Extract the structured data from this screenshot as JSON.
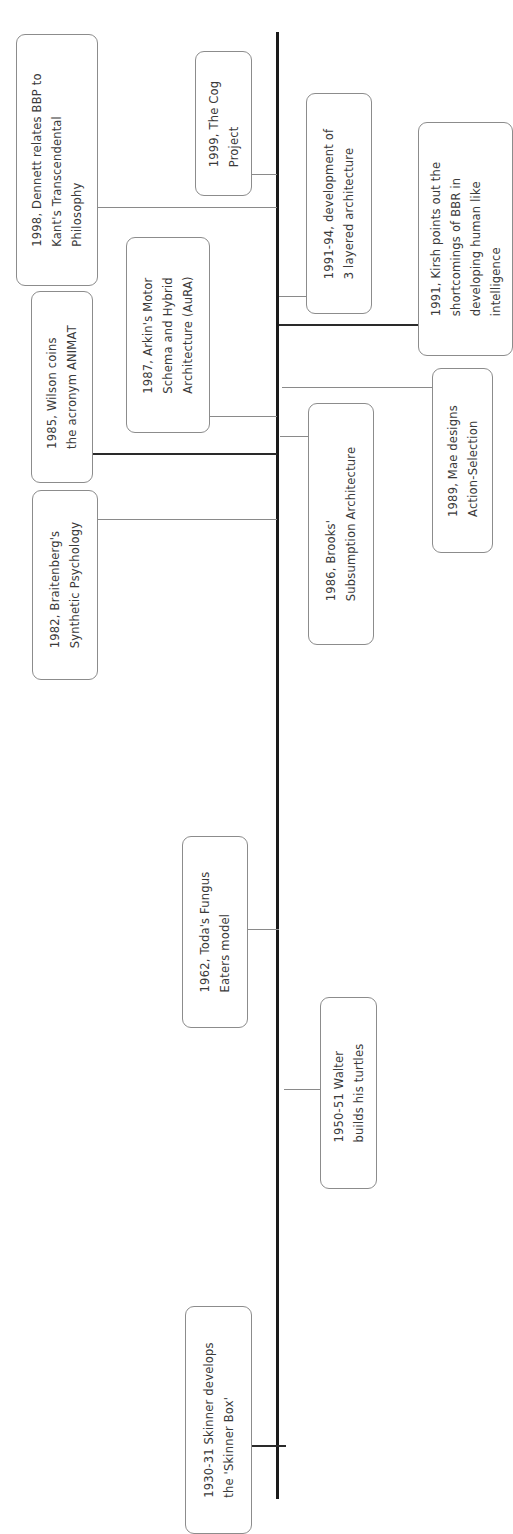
{
  "diagram": {
    "type": "vertical timeline (rotated 90°)",
    "events": [
      {
        "id": "dennett",
        "label": "1998, Dennett relates BBP to\nKant's Transcendental\nPhilosophy"
      },
      {
        "id": "cog",
        "label": "1999, The Cog\nProject"
      },
      {
        "id": "three-layer",
        "label": "1991-94, development of\n3 layered architecture"
      },
      {
        "id": "kirsh",
        "label": "1991, Kirsh points out the\nshortcomings of BBR in\ndeveloping human like\nintelligence"
      },
      {
        "id": "wilson",
        "label": "1985, Wilson coins\nthe acronym ANIMAT"
      },
      {
        "id": "arkin",
        "label": "1987, Arkin's Motor\nSchema and Hybrid\nArchitecture (AuRA)"
      },
      {
        "id": "mae",
        "label": "1989, Mae designs\nAction-Selection"
      },
      {
        "id": "brooks",
        "label": "1986, Brooks'\nSubsumption Architecture"
      },
      {
        "id": "braitenberg",
        "label": "1982, Braitenberg's\nSynthetic Psychology"
      },
      {
        "id": "toda",
        "label": "1962, Toda's Fungus\nEaters model"
      },
      {
        "id": "walter",
        "label": "1950-51 Walter\nbuilds his turtles"
      },
      {
        "id": "skinner",
        "label": "1930-31 Skinner develops\nthe 'Skinner Box'"
      }
    ]
  },
  "colors": {
    "axis": "#1a1a1a",
    "box_border": "#8c8c8c",
    "text": "#3a3a3a",
    "connector": "#8a8a8a"
  }
}
